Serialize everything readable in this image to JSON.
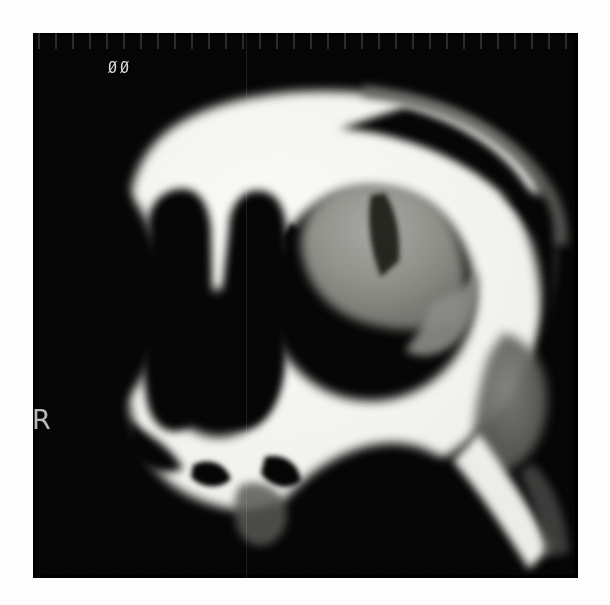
{
  "viewer": {
    "background_color": "#fdfdfd",
    "field_color": "#050505"
  },
  "scan": {
    "modality": "CT",
    "region": "paranasal sinuses / midface",
    "field": {
      "x": 33,
      "y": 33,
      "width": 545,
      "height": 545
    },
    "annotations": {
      "series_marker": "ØØ",
      "laterality_marker": "R"
    },
    "palette": {
      "bone_white": "#f2f2ee",
      "bone_bright": "#fafaf6",
      "soft_tissue_gray": "#9a9a96",
      "soft_tissue_dark": "#5e5e5c",
      "air_black": "#090909",
      "background_black": "#050505",
      "text_gray": "#c9c9c9"
    },
    "structures": [
      {
        "name": "calvarium-frontal-bone",
        "density": "bone",
        "label": "frontal bone / skull vault"
      },
      {
        "name": "nasal-cavity-right",
        "density": "air",
        "label": "right nasal cavity"
      },
      {
        "name": "nasal-cavity-left",
        "density": "air",
        "label": "left nasal cavity"
      },
      {
        "name": "nasal-septum",
        "density": "bone",
        "label": "nasal septum"
      },
      {
        "name": "maxillary-sinus-left",
        "density": "air-with-opacity",
        "label": "left maxillary sinus with soft tissue opacity"
      },
      {
        "name": "soft-tissue-mass",
        "density": "soft-tissue",
        "label": "soft tissue density within sinus"
      },
      {
        "name": "temporal-soft-tissue",
        "density": "soft-tissue",
        "label": "lateral soft tissues"
      },
      {
        "name": "orbital-floor",
        "density": "bone",
        "label": "orbital floor / zygoma"
      },
      {
        "name": "alveolar-ridge",
        "density": "bone",
        "label": "alveolar process / hard palate"
      },
      {
        "name": "mandibular-ramus",
        "density": "bone",
        "label": "mandibular ramus"
      }
    ]
  }
}
